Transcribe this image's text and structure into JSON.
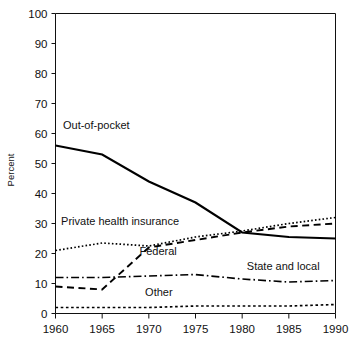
{
  "chart_data": {
    "type": "line",
    "title": "",
    "xlabel": "",
    "ylabel": "Percent",
    "x": [
      1960,
      1965,
      1970,
      1975,
      1980,
      1985,
      1990
    ],
    "xlim": [
      1960,
      1990
    ],
    "ylim": [
      0,
      100
    ],
    "yticks": [
      0,
      10,
      20,
      30,
      40,
      50,
      60,
      70,
      80,
      90,
      100
    ],
    "xticks": [
      1960,
      1965,
      1970,
      1975,
      1980,
      1985,
      1990
    ],
    "ytick_labels": [
      "0",
      "10",
      "20",
      "30",
      "40",
      "50",
      "60",
      "70",
      "80",
      "90",
      "100"
    ],
    "xtick_labels": [
      "1960",
      "1965",
      "1970",
      "1975",
      "1980",
      "1985",
      "1990"
    ],
    "grid": false,
    "legend_position": "inline-labels",
    "series": [
      {
        "name": "Out-of-pocket",
        "style": "solid",
        "label": "Out-of-pocket",
        "values": [
          56,
          53,
          44,
          37,
          27,
          25.5,
          25
        ]
      },
      {
        "name": "Private health insurance",
        "style": "dotted",
        "label": "Private health insurance",
        "values": [
          21,
          23.5,
          22.5,
          25.5,
          27.5,
          30,
          32
        ]
      },
      {
        "name": "Federal",
        "style": "dashed",
        "label": "Federal",
        "values": [
          9,
          8,
          22,
          24.5,
          27,
          29,
          30
        ]
      },
      {
        "name": "State and local",
        "style": "dash-dot",
        "label": "State and local",
        "values": [
          12,
          12,
          12.5,
          13,
          11.5,
          10.5,
          11
        ]
      },
      {
        "name": "Other",
        "style": "fine-dotted",
        "label": "Other",
        "values": [
          2,
          2,
          2,
          2.5,
          2.5,
          2.5,
          3
        ]
      }
    ],
    "annotations": [
      {
        "text": "Out-of-pocket",
        "x": 1960.8,
        "y": 61.5
      },
      {
        "text": "Private health insurance",
        "x": 1960.6,
        "y": 29.5
      },
      {
        "text": "Federal",
        "x": 1969.0,
        "y": 19.5
      },
      {
        "text": "State and local",
        "x": 1980.5,
        "y": 14.5
      },
      {
        "text": "Other",
        "x": 1969.6,
        "y": 6.0
      }
    ]
  },
  "axis": {
    "y_title": "Percent"
  }
}
